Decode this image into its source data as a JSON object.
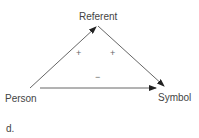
{
  "nodes": {
    "referent": "Referent",
    "person": "Person",
    "symbol": "Symbol"
  },
  "signs": {
    "left_edge": "+",
    "right_edge": "+",
    "bottom_edge": "−"
  },
  "caption": "d.",
  "colors": {
    "line": "#333333",
    "text": "#444444"
  }
}
